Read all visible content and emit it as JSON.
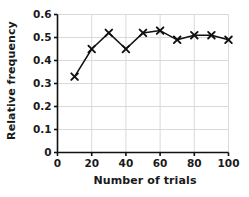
{
  "chart_data": {
    "type": "line",
    "title": "",
    "xlabel": "Number of trials",
    "ylabel": "Relative frequency",
    "x": [
      10,
      20,
      30,
      40,
      50,
      60,
      70,
      80,
      90,
      100
    ],
    "values": [
      0.33,
      0.45,
      0.52,
      0.45,
      0.52,
      0.53,
      0.49,
      0.51,
      0.51,
      0.49
    ],
    "series": [
      {
        "name": "Relative frequency",
        "values": [
          0.33,
          0.45,
          0.52,
          0.45,
          0.52,
          0.53,
          0.49,
          0.51,
          0.51,
          0.49
        ]
      }
    ],
    "xlim": [
      0,
      100
    ],
    "ylim": [
      0,
      0.6
    ],
    "xticks": [
      0,
      20,
      40,
      60,
      80,
      100
    ],
    "xtick_labels": [
      "0",
      "20",
      "40",
      "60",
      "80",
      "100"
    ],
    "yticks": [
      0,
      0.1,
      0.2,
      0.3,
      0.4,
      0.5,
      0.6
    ],
    "ytick_labels": [
      "0",
      "0.1",
      "0.2",
      "0.3",
      "0.4",
      "0.5",
      "0.6"
    ],
    "grid": true,
    "grid_color": "#d9d9d9",
    "legend": false,
    "legend_position": "none",
    "marker": "x",
    "line_color": "#111111",
    "marker_color": "#111111",
    "background": "#ffffff"
  }
}
